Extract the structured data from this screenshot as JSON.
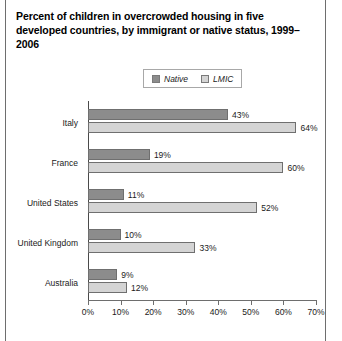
{
  "chart_data": {
    "type": "bar",
    "orientation": "horizontal",
    "title": "Percent of children in overcrowded housing in five developed countries, by immigrant or native status, 1999–2006",
    "xlabel": "",
    "ylabel": "",
    "xlim": [
      0,
      70
    ],
    "xtick_labels": [
      "0%",
      "10%",
      "20%",
      "30%",
      "40%",
      "50%",
      "60%",
      "70%"
    ],
    "xtick_values": [
      0,
      10,
      20,
      30,
      40,
      50,
      60,
      70
    ],
    "grid": false,
    "legend_position": "top-center",
    "categories": [
      "Italy",
      "France",
      "United States",
      "United Kingdom",
      "Australia"
    ],
    "series": [
      {
        "name": "Native",
        "color": "#8c8c8c",
        "values": [
          43,
          19,
          11,
          10,
          9
        ],
        "value_labels": [
          "43%",
          "19%",
          "11%",
          "10%",
          "9%"
        ]
      },
      {
        "name": "LMIC",
        "color": "#d4d4d4",
        "values": [
          64,
          60,
          52,
          33,
          12
        ],
        "value_labels": [
          "64%",
          "60%",
          "52%",
          "33%",
          "12%"
        ]
      }
    ]
  },
  "colors": {
    "native": "#8c8c8c",
    "lmic": "#d4d4d4",
    "bar_border": "#6f6f6f",
    "axis": "#6e6e6e",
    "text": "#1a1a1a",
    "background": "#ffffff"
  }
}
